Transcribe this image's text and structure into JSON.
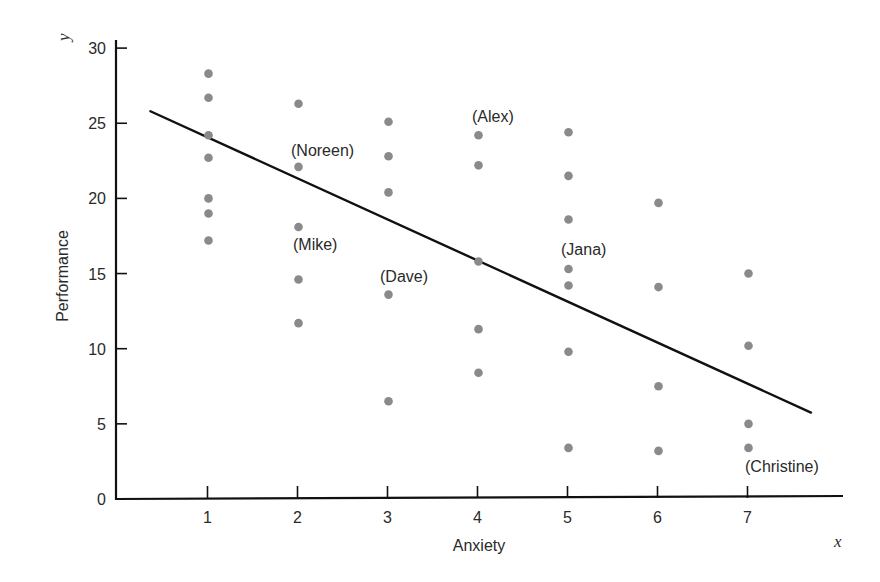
{
  "chart_data": {
    "type": "scatter",
    "title": "",
    "xlabel": "Anxiety",
    "ylabel": "Performance",
    "x_axis_variable": "x",
    "y_axis_variable": "y",
    "xlim": [
      0,
      8
    ],
    "ylim": [
      0,
      30
    ],
    "x_ticks": [
      1,
      2,
      3,
      4,
      5,
      6,
      7
    ],
    "y_ticks": [
      0,
      5,
      10,
      15,
      20,
      25,
      30
    ],
    "grid": false,
    "legend": null,
    "point_color": "#8a8a8a",
    "line_color": "#111111",
    "points": [
      {
        "x": 1,
        "y": 28.3
      },
      {
        "x": 1,
        "y": 26.7
      },
      {
        "x": 1,
        "y": 24.2
      },
      {
        "x": 1,
        "y": 22.7
      },
      {
        "x": 1,
        "y": 20.0
      },
      {
        "x": 1,
        "y": 19.0
      },
      {
        "x": 1,
        "y": 17.2
      },
      {
        "x": 2,
        "y": 26.3
      },
      {
        "x": 2,
        "y": 22.1,
        "label": "Noreen"
      },
      {
        "x": 2,
        "y": 18.1,
        "label": "Mike"
      },
      {
        "x": 2,
        "y": 14.6
      },
      {
        "x": 2,
        "y": 11.7
      },
      {
        "x": 3,
        "y": 25.1
      },
      {
        "x": 3,
        "y": 22.8
      },
      {
        "x": 3,
        "y": 20.4
      },
      {
        "x": 3,
        "y": 13.6,
        "label": "Dave"
      },
      {
        "x": 3,
        "y": 6.5
      },
      {
        "x": 4,
        "y": 24.2,
        "label": "Alex"
      },
      {
        "x": 4,
        "y": 22.2
      },
      {
        "x": 4,
        "y": 15.8
      },
      {
        "x": 4,
        "y": 11.3
      },
      {
        "x": 4,
        "y": 8.4
      },
      {
        "x": 5,
        "y": 24.4
      },
      {
        "x": 5,
        "y": 21.5
      },
      {
        "x": 5,
        "y": 18.6
      },
      {
        "x": 5,
        "y": 15.3,
        "label": "Jana"
      },
      {
        "x": 5,
        "y": 14.2
      },
      {
        "x": 5,
        "y": 9.8
      },
      {
        "x": 5,
        "y": 3.4
      },
      {
        "x": 6,
        "y": 19.7
      },
      {
        "x": 6,
        "y": 14.1
      },
      {
        "x": 6,
        "y": 7.5
      },
      {
        "x": 6,
        "y": 3.2
      },
      {
        "x": 7,
        "y": 15.0
      },
      {
        "x": 7,
        "y": 10.2
      },
      {
        "x": 7,
        "y": 5.0
      },
      {
        "x": 7,
        "y": 3.4,
        "label": "Christine"
      }
    ],
    "regression_line": {
      "x_start": 0.36,
      "y_start": 25.8,
      "x_end": 7.7,
      "y_end": 5.75,
      "slope": -2.73,
      "intercept": 26.8
    },
    "annotations": [
      {
        "text": "(Noreen)",
        "x": 2,
        "y": 22.1
      },
      {
        "text": "(Mike)",
        "x": 2,
        "y": 18.1
      },
      {
        "text": "(Dave)",
        "x": 3,
        "y": 13.6
      },
      {
        "text": "(Alex)",
        "x": 4,
        "y": 24.2
      },
      {
        "text": "(Jana)",
        "x": 5,
        "y": 15.3
      },
      {
        "text": "(Christine)",
        "x": 7,
        "y": 3.4
      }
    ]
  },
  "labels": {
    "xlabel": "Anxiety",
    "ylabel": "Performance",
    "xvar": "x",
    "yvar": "y",
    "noreen": "(Noreen)",
    "mike": "(Mike)",
    "dave": "(Dave)",
    "alex": "(Alex)",
    "jana": "(Jana)",
    "christine": "(Christine)"
  },
  "ticks": {
    "x": [
      "1",
      "2",
      "3",
      "4",
      "5",
      "6",
      "7"
    ],
    "y": [
      "0",
      "5",
      "10",
      "15",
      "20",
      "25",
      "30"
    ]
  }
}
